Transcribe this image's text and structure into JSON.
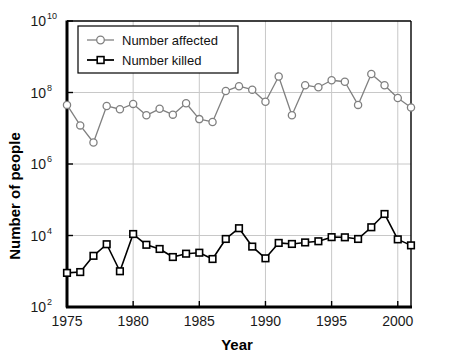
{
  "chart_data": {
    "type": "line",
    "title": "",
    "xlabel": "Year",
    "ylabel": "Number of people",
    "xlim": [
      1975,
      2001
    ],
    "ylim": [
      100,
      10000000000
    ],
    "yscale": "log",
    "grid": true,
    "legend_position": "top-left",
    "x_ticks": [
      1975,
      1980,
      1985,
      1990,
      1995,
      2000
    ],
    "x_tick_labels": [
      "1975",
      "1980",
      "1985",
      "1990",
      "1995",
      "2000"
    ],
    "y_ticks": [
      100,
      10000,
      1000000,
      100000000,
      10000000000
    ],
    "y_tick_labels": [
      "10²",
      "10⁴",
      "10⁶",
      "10⁸",
      "10¹⁰"
    ],
    "y_tick_bases": [
      "10",
      "10",
      "10",
      "10",
      "10"
    ],
    "y_tick_exponents": [
      "2",
      "4",
      "6",
      "8",
      "10"
    ],
    "x": [
      1975,
      1976,
      1977,
      1978,
      1979,
      1980,
      1981,
      1982,
      1983,
      1984,
      1985,
      1986,
      1987,
      1988,
      1989,
      1990,
      1991,
      1992,
      1993,
      1994,
      1995,
      1996,
      1997,
      1998,
      1999,
      2000,
      2001
    ],
    "series": [
      {
        "name": "Number affected",
        "marker": "circle",
        "color": "#808080",
        "values": [
          45000000.0,
          12000000.0,
          4000000.0,
          42000000.0,
          34000000.0,
          48000000.0,
          23000000.0,
          35000000.0,
          24000000.0,
          50000000.0,
          18000000.0,
          15000000.0,
          110000000.0,
          150000000.0,
          120000000.0,
          55000000.0,
          280000000.0,
          23000000.0,
          160000000.0,
          140000000.0,
          220000000.0,
          200000000.0,
          45000000.0,
          330000000.0,
          160000000.0,
          70000000.0,
          38000000.0
        ]
      },
      {
        "name": "Number killed",
        "marker": "square",
        "color": "#000000",
        "values": [
          900,
          950,
          2700,
          5700,
          1000,
          11000,
          5500,
          4200,
          2500,
          3100,
          3300,
          2200,
          8000,
          16000,
          4900,
          2300,
          6200,
          5800,
          6400,
          6900,
          9000,
          8900,
          8000,
          17000,
          40000,
          7800,
          5300
        ]
      }
    ]
  },
  "legend": {
    "items": [
      {
        "label": "Number affected",
        "marker": "circle",
        "color": "#808080"
      },
      {
        "label": "Number killed",
        "marker": "square",
        "color": "#000000"
      }
    ]
  }
}
